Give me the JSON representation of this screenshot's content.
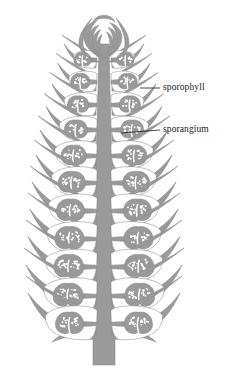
{
  "figure": {
    "domain": "Diagram",
    "kind": "botanical-line-drawing",
    "background_color": "#ffffff",
    "tissue_color": "#9a9a9a",
    "tissue_color_light": "#a8a8a8",
    "outline_color": "#8e8e8e",
    "lumen_color": "#ffffff",
    "spore_color": "#ffffff",
    "label_color": "#1a1a1a",
    "leader_color": "#1a1a1a",
    "caption_color": "#b9b9b9",
    "caption_text": ""
  },
  "labels": [
    {
      "id": "sporophyll",
      "text": "sporophyll",
      "leader": {
        "x1": 140,
        "y1": 88,
        "x2": 160,
        "y2": 88
      },
      "text_x": 163,
      "text_y": 83
    },
    {
      "id": "sporangium",
      "text": "sporangium",
      "leader": {
        "x1": 121,
        "y1": 133,
        "x2": 160,
        "y2": 130
      },
      "text_x": 163,
      "text_y": 125
    }
  ],
  "structure": {
    "axis": {
      "name": "central-axis",
      "top_y": 44,
      "bottom_y": 330,
      "half_width_top": 5,
      "half_width_bottom": 11,
      "center_x": 104
    },
    "peduncle": {
      "name": "basal-stalk",
      "top_y": 330,
      "bottom_y": 365,
      "half_width": 11
    },
    "apex": {
      "name": "cone-apex",
      "tip_y": 12,
      "base_y": 60,
      "immature_sporophyll_count": 7
    },
    "sporophyll_pairs": [
      {
        "index": 0,
        "y": 60,
        "span": 26,
        "length": 30,
        "sporangium_rx": 8.5,
        "sporangium_ry": 7.0,
        "spores": 10,
        "mature": 0.35
      },
      {
        "index": 1,
        "y": 82,
        "span": 30,
        "length": 36,
        "sporangium_rx": 9.5,
        "sporangium_ry": 7.8,
        "spores": 12,
        "mature": 0.45
      },
      {
        "index": 2,
        "y": 105,
        "span": 34,
        "length": 42,
        "sporangium_rx": 10.5,
        "sporangium_ry": 8.4,
        "spores": 14,
        "mature": 0.55
      },
      {
        "index": 3,
        "y": 130,
        "span": 38,
        "length": 48,
        "sporangium_rx": 11.5,
        "sporangium_ry": 9.2,
        "spores": 16,
        "mature": 0.65
      },
      {
        "index": 4,
        "y": 156,
        "span": 42,
        "length": 54,
        "sporangium_rx": 12.5,
        "sporangium_ry": 10.0,
        "spores": 19,
        "mature": 0.75
      },
      {
        "index": 5,
        "y": 183,
        "span": 45,
        "length": 58,
        "sporangium_rx": 13.5,
        "sporangium_ry": 10.6,
        "spores": 22,
        "mature": 0.82
      },
      {
        "index": 6,
        "y": 211,
        "span": 47,
        "length": 62,
        "sporangium_rx": 14.0,
        "sporangium_ry": 11.0,
        "spores": 24,
        "mature": 0.88
      },
      {
        "index": 7,
        "y": 239,
        "span": 48,
        "length": 64,
        "sporangium_rx": 14.5,
        "sporangium_ry": 11.4,
        "spores": 26,
        "mature": 0.93
      },
      {
        "index": 8,
        "y": 267,
        "span": 49,
        "length": 66,
        "sporangium_rx": 14.8,
        "sporangium_ry": 11.6,
        "spores": 27,
        "mature": 0.97
      },
      {
        "index": 9,
        "y": 296,
        "span": 50,
        "length": 68,
        "sporangium_rx": 15.0,
        "sporangium_ry": 11.8,
        "spores": 28,
        "mature": 1.0
      },
      {
        "index": 10,
        "y": 324,
        "span": 50,
        "length": 66,
        "sporangium_rx": 14.0,
        "sporangium_ry": 11.0,
        "spores": 24,
        "mature": 1.0
      }
    ]
  }
}
